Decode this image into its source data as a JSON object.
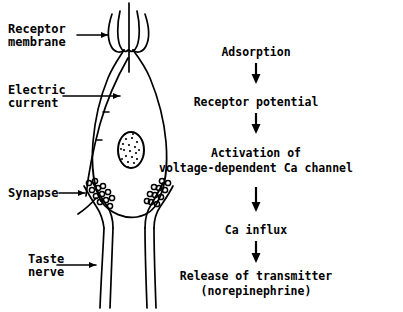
{
  "figure": {
    "ink_color": "#000000",
    "background_color": "#ffffff"
  },
  "anatomy": {
    "labels": [
      {
        "id": "receptor-membrane",
        "text": "Receptor\nmembrane",
        "points_to": "microvilli at apex of taste receptor cell"
      },
      {
        "id": "electric-current",
        "text": "Electric\ncurrent",
        "points_to": "interior of receptor cell"
      },
      {
        "id": "synapse",
        "text": "Synapse",
        "points_to": "synaptic vesicle cluster at cell base"
      },
      {
        "id": "taste-nerve",
        "text": "Taste\nnerve",
        "points_to": "afferent nerve fiber"
      }
    ],
    "structures": {
      "microvilli": "microvilli",
      "nucleus": "nucleus",
      "vesicles": "synaptic vesicles",
      "cell_body": "taste receptor cell",
      "nerve_fibers": "taste nerve fibers"
    }
  },
  "flowchart": {
    "orientation": "vertical",
    "arrow_glyph": "downward-arrow",
    "steps": [
      {
        "id": "adsorption",
        "text": "Adsorption"
      },
      {
        "id": "receptor-potential",
        "text": "Receptor potential"
      },
      {
        "id": "activation-line1",
        "text": "Activation of"
      },
      {
        "id": "activation-line2",
        "text": "voltage-dependent Ca channel"
      },
      {
        "id": "ca-influx",
        "text": "Ca influx"
      },
      {
        "id": "release-line1",
        "text": "Release of transmitter"
      },
      {
        "id": "release-line2",
        "text": "(norepinephrine)"
      }
    ],
    "arrows": [
      {
        "id": "arrow-1",
        "from": "adsorption",
        "to": "receptor-potential"
      },
      {
        "id": "arrow-2",
        "from": "receptor-potential",
        "to": "activation"
      },
      {
        "id": "arrow-3",
        "from": "activation",
        "to": "ca-influx"
      },
      {
        "id": "arrow-4",
        "from": "ca-influx",
        "to": "release"
      }
    ]
  }
}
